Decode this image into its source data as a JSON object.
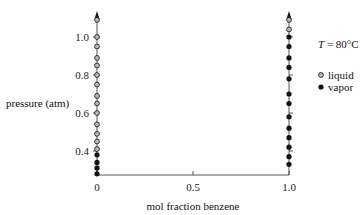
{
  "chart_data": {
    "type": "scatter",
    "title": "",
    "xlabel": "mol fraction benzene",
    "ylabel": "pressure (atm)",
    "xlim": [
      0,
      1.0
    ],
    "ylim": [
      0.275,
      1.09
    ],
    "x_ticks": [
      "0",
      "0.5",
      "1.0"
    ],
    "y_ticks": [
      "0.4",
      "0.6",
      "0.8",
      "1.0"
    ],
    "annotation": {
      "T_symbol": "T",
      "T_value": " = 80°C"
    },
    "legend": [
      {
        "label": "liquid",
        "marker": "open-circle"
      },
      {
        "label": "vapor",
        "marker": "filled-circle"
      }
    ],
    "series": [
      {
        "name": "liquid",
        "marker": "open-circle",
        "points": [
          {
            "x": 0,
            "y": 1.09
          },
          {
            "x": 0,
            "y": 1.0
          },
          {
            "x": 0,
            "y": 0.95
          },
          {
            "x": 0,
            "y": 0.89
          },
          {
            "x": 0,
            "y": 0.85
          },
          {
            "x": 0,
            "y": 0.8
          },
          {
            "x": 0,
            "y": 0.75
          },
          {
            "x": 0,
            "y": 0.69
          },
          {
            "x": 0,
            "y": 0.65
          },
          {
            "x": 0,
            "y": 0.6
          },
          {
            "x": 0,
            "y": 0.54
          },
          {
            "x": 0,
            "y": 0.49
          },
          {
            "x": 0,
            "y": 0.45
          },
          {
            "x": 0,
            "y": 0.41
          },
          {
            "x": 1.0,
            "y": 1.09
          },
          {
            "x": 1.0,
            "y": 1.04
          }
        ]
      },
      {
        "name": "vapor",
        "marker": "filled-circle",
        "points": [
          {
            "x": 0,
            "y": 0.38
          },
          {
            "x": 0,
            "y": 0.34
          },
          {
            "x": 0,
            "y": 0.31
          },
          {
            "x": 0,
            "y": 0.28
          },
          {
            "x": 1.0,
            "y": 1.0
          },
          {
            "x": 1.0,
            "y": 0.95
          },
          {
            "x": 1.0,
            "y": 0.89
          },
          {
            "x": 1.0,
            "y": 0.84
          },
          {
            "x": 1.0,
            "y": 0.78
          },
          {
            "x": 1.0,
            "y": 0.7
          },
          {
            "x": 1.0,
            "y": 0.65
          },
          {
            "x": 1.0,
            "y": 0.58
          },
          {
            "x": 1.0,
            "y": 0.52
          },
          {
            "x": 1.0,
            "y": 0.47
          },
          {
            "x": 1.0,
            "y": 0.42
          },
          {
            "x": 1.0,
            "y": 0.37
          },
          {
            "x": 1.0,
            "y": 0.33
          }
        ]
      }
    ],
    "grid": false,
    "legend_position": "right"
  },
  "colors": {
    "axis": "#555555",
    "marker_fill_open": "#bbbbbb",
    "marker_stroke": "#222222",
    "marker_fill_filled": "#111111"
  }
}
